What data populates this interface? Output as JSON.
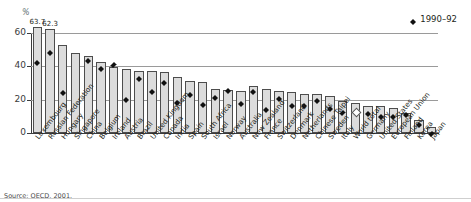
{
  "axis": {
    "unit_label": "%",
    "y_ticks": [
      "0",
      "20",
      "40",
      "60"
    ],
    "y_min": 0,
    "y_max": 60
  },
  "legend": {
    "marker_icon": "diamond-marker",
    "label": "1990–92"
  },
  "source": {
    "text": "Source: OECD, 2001."
  },
  "chart_data": {
    "type": "bar",
    "title": "",
    "subtitle": "",
    "xlabel": "",
    "ylabel": "%",
    "ylim": [
      0,
      60
    ],
    "grid": true,
    "legend_position": "top-right",
    "categories": [
      "Luxembourg",
      "Russian Federation",
      "Hungary",
      "Singapore",
      "China",
      "Belgium",
      "Ireland",
      "Austria",
      "Brazil",
      "United Kingdom",
      "Canada",
      "India",
      "Spain",
      "South Africa",
      "Israel",
      "Norway",
      "Australia",
      "New Zealand",
      "France",
      "Switzerland",
      "Denmark",
      "Netherlands",
      "Chinese Taipei",
      "Sweden",
      "Italy",
      "World total",
      "Germany",
      "United States",
      "European Union",
      "Finland",
      "Korea",
      "Japan"
    ],
    "series": [
      {
        "name": "Recent",
        "type": "bar",
        "values": [
          63.7,
          62.3,
          53.0,
          48.0,
          46.0,
          42.5,
          39.5,
          38.5,
          37.5,
          37.5,
          36.5,
          33.5,
          31.5,
          30.5,
          26.5,
          26.0,
          25.5,
          28.0,
          26.5,
          25.5,
          24.5,
          23.5,
          23.5,
          22.0,
          19.5,
          18.0,
          16.5,
          16.0,
          15.0,
          12.0,
          8.0,
          3.5
        ],
        "data_labels": {
          "0": "63.7",
          "1": "62.3"
        }
      },
      {
        "name": "1990–92",
        "type": "scatter",
        "marker": "diamond",
        "values": [
          44.0,
          50.0,
          26.0,
          null,
          45.0,
          40.5,
          42.5,
          21.5,
          34.0,
          26.5,
          32.0,
          20.0,
          24.5,
          18.5,
          23.0,
          27.0,
          19.5,
          26.5,
          15.5,
          22.5,
          18.0,
          18.0,
          21.0,
          16.0,
          14.0,
          12.5,
          13.5,
          11.5,
          11.5,
          12.5,
          6.5,
          1.5
        ],
        "open_markers": [
          25
        ]
      }
    ]
  }
}
